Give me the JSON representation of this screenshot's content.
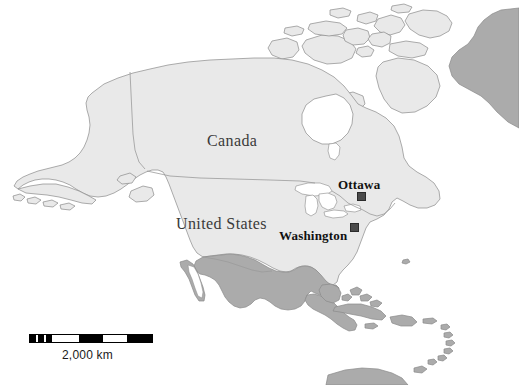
{
  "figure": {
    "type": "reference-map",
    "background_color": "#ffffff",
    "width": 519,
    "height": 385
  },
  "colors": {
    "ocean": "#ffffff",
    "land_highlight": "#e9e9e9",
    "land_other": "#ababab",
    "coastline": "#8a8a8a",
    "border": "#9a9a9a",
    "label_country": "#3a3a3a",
    "label_city": "#111111",
    "marker": "#4a4a4a",
    "scale_bar": "#000000"
  },
  "labels": {
    "countries": [
      {
        "name": "canada",
        "text": "Canada"
      },
      {
        "name": "united-states",
        "text": "United States"
      }
    ],
    "cities": [
      {
        "name": "ottawa",
        "text": "Ottawa",
        "marker": "square"
      },
      {
        "name": "washington",
        "text": "Washington",
        "marker": "square"
      }
    ]
  },
  "scale": {
    "label": "2,000 km",
    "segments": [
      {
        "style": "fill",
        "width": 7
      },
      {
        "style": "blank",
        "width": 3
      },
      {
        "style": "fill",
        "width": 7
      },
      {
        "style": "blank",
        "width": 3
      },
      {
        "style": "fill",
        "width": 7
      },
      {
        "style": "blank",
        "width": 34
      },
      {
        "style": "fill",
        "width": 31
      },
      {
        "style": "blank",
        "width": 30
      },
      {
        "style": "fill",
        "width": 31
      }
    ]
  }
}
